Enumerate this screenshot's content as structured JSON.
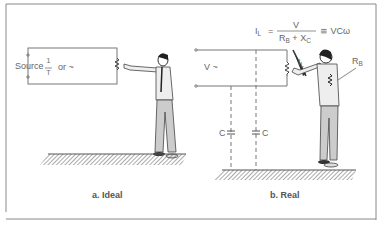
{
  "panels": [
    {
      "id": "ideal",
      "caption": "a. Ideal",
      "source_label": "Source",
      "freq_numerator": "1",
      "freq_denominator": "T",
      "freq_or": "or ~"
    },
    {
      "id": "real",
      "caption": "b. Real",
      "voltage_label": "V ~",
      "current_label": "I",
      "current_sub": "L",
      "body_resistance_label": "R",
      "body_resistance_sub": "B",
      "capacitor_left_label": "C",
      "capacitor_right_label": "C",
      "formula": {
        "lhs": "I",
        "lhs_sub": "L",
        "equals": "=",
        "numerator": "V",
        "den_r": "R",
        "den_r_sub": "B",
        "den_plus": "+",
        "den_x": "X",
        "den_x_sub": "C",
        "approx": "≅ VCω"
      }
    }
  ],
  "colors": {
    "line": "#777777",
    "frame": "#888888",
    "text": "#555555"
  }
}
